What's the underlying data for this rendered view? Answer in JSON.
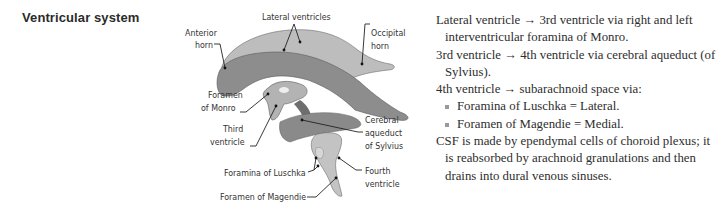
{
  "heading": "Ventricular system",
  "diagram": {
    "labels": {
      "lateral_ventricles": "Lateral ventricles",
      "anterior_horn_1": "Anterior",
      "anterior_horn_2": "horn",
      "occipital_horn_1": "Occipital",
      "occipital_horn_2": "horn",
      "foramen_monro_1": "Foramen",
      "foramen_monro_2": "of Monro",
      "third_ventricle_1": "Third",
      "third_ventricle_2": "ventricle",
      "cerebral_aqueduct_1": "Cerebral",
      "cerebral_aqueduct_2": "aqueduct",
      "cerebral_aqueduct_3": "of Sylvius",
      "foramina_luschka": "Foramina of Luschka",
      "fourth_ventricle_1": "Fourth",
      "fourth_ventricle_2": "ventricle",
      "foramen_magendie": "Foramen of Magendie"
    },
    "colors": {
      "light_fill": "#b9b9b9",
      "dark_fill": "#8a8a8a",
      "outline": "#555555"
    }
  },
  "notes": {
    "line1": "Lateral ventricle → 3rd ventricle via right and left interventricular foramina of Monro.",
    "line2": "3rd ventricle → 4th ventricle via cerebral aqueduct (of Sylvius).",
    "line3": "4th ventricle → subarachnoid space via:",
    "bullets": [
      "Foramina of Luschka = Lateral.",
      "Foramen of Magendie = Medial."
    ],
    "line4": "CSF is made by ependymal cells of choroid plexus; it is reabsorbed by arachnoid granulations and then drains into dural venous sinuses."
  }
}
